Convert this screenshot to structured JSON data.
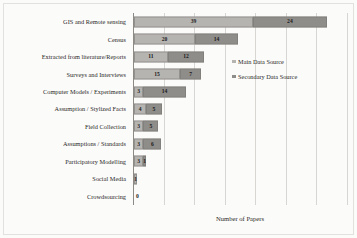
{
  "chart_data": {
    "type": "bar",
    "orientation": "horizontal",
    "stacked": true,
    "title": "",
    "xlabel": "Number of Papers",
    "ylabel": "",
    "xlim": [
      0,
      70
    ],
    "grid": true,
    "gridline_values": [
      0,
      10,
      20,
      30,
      40,
      50,
      60,
      70
    ],
    "legend_position": "upper-right",
    "categories": [
      "Crowdsourcing",
      "Social Media",
      "Participatory Modelling",
      "Assumptions / Standards",
      "Field Collection",
      "Assumption / Stylized Facts",
      "Computer Models / Experiments",
      "Surveys and Interviews",
      "Extracted from literature/Reports",
      "Census",
      "GIS and Remote sensing"
    ],
    "series": [
      {
        "name": "Main Data Source",
        "color": "#b6b4b1",
        "values": [
          0,
          1,
          3,
          3,
          3,
          4,
          3,
          15,
          11,
          20,
          39
        ]
      },
      {
        "name": "Secondary Data Source",
        "color": "#8f8d8a",
        "values": [
          0,
          0,
          1,
          6,
          5,
          5,
          14,
          7,
          12,
          14,
          24
        ]
      }
    ]
  },
  "axis": {
    "x_title": "Number of Papers"
  },
  "legend": {
    "items": [
      {
        "label": "Main Data Source"
      },
      {
        "label": "Secondary Data Source"
      }
    ]
  }
}
